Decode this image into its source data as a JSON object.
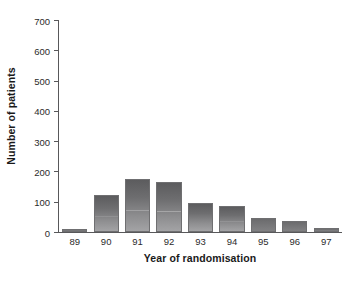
{
  "chart_data": {
    "type": "bar",
    "title": "",
    "xlabel": "Year of randomisation",
    "ylabel": "Number of patients",
    "categories": [
      "89",
      "90",
      "91",
      "92",
      "93",
      "94",
      "95",
      "96",
      "97"
    ],
    "values": [
      10,
      122,
      175,
      165,
      96,
      86,
      46,
      36,
      13
    ],
    "ylim": [
      0,
      700
    ],
    "yticks": [
      0,
      100,
      200,
      300,
      400,
      500,
      600,
      700
    ],
    "ytick_labels": [
      "0",
      "100",
      "200",
      "300",
      "400",
      "500",
      "600",
      "700"
    ],
    "grid": false,
    "legend": null,
    "bar_color": "#6e6e70",
    "axis_color": "#58585a",
    "background": "#ffffff"
  }
}
